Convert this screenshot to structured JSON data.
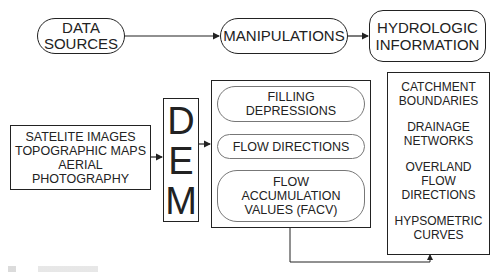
{
  "top_row": {
    "data_sources": "DATA\nSOURCES",
    "manipulations": "MANIPULATIONS",
    "hydrologic_information": "HYDROLOGIC\nINFORMATION"
  },
  "sources_box": {
    "lines": [
      "SATELITE IMAGES",
      "TOPOGRAPHIC MAPS",
      "AERIAL",
      "PHOTOGRAPHY"
    ]
  },
  "dem_box": {
    "letters": [
      "D",
      "E",
      "M"
    ]
  },
  "manipulation_steps": [
    "FILLING\nDEPRESSIONS",
    "FLOW DIRECTIONS",
    "FLOW\nACCUMULATION\nVALUES (FACV)"
  ],
  "outputs": [
    "CATCHMENT\nBOUNDARIES",
    "DRAINAGE\nNETWORKS",
    "OVERLAND\nFLOW\nDIRECTIONS",
    "HYPSOMETRIC\nCURVES"
  ],
  "colors": {
    "stroke": "#222222",
    "inner_stroke": "#777777",
    "background": "#ffffff"
  }
}
